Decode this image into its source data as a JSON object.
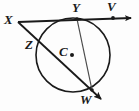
{
  "figure": {
    "kind": "circle-geometry-diagram",
    "background_color": "#fdfdfd",
    "stroke_color": "#1a1a1a",
    "width": 139,
    "height": 111,
    "labels": {
      "X": "X",
      "Y": "Y",
      "V": "V",
      "Z": "Z",
      "C": "C",
      "W": "W"
    },
    "points": {
      "X": {
        "x": 18,
        "y": 22
      },
      "Y": {
        "x": 77,
        "y": 19
      },
      "V": {
        "x": 113,
        "y": 18
      },
      "Z": {
        "x": 41,
        "y": 42
      },
      "C": {
        "x": 73,
        "y": 55
      },
      "W": {
        "x": 92,
        "y": 90
      }
    },
    "circle": {
      "center_x": 73,
      "center_y": 55,
      "radius": 37
    },
    "segments": [
      {
        "name": "tangent-ray-XV",
        "from": "X",
        "to": "V",
        "arrow": true
      },
      {
        "name": "secant-ray-XZW",
        "from": "X",
        "through": "Z",
        "to": "W",
        "arrow": true
      },
      {
        "name": "chord-YW",
        "from": "Y",
        "to": "W",
        "arrow": false
      }
    ],
    "marked_points": [
      "Y",
      "V",
      "C",
      "W"
    ]
  }
}
